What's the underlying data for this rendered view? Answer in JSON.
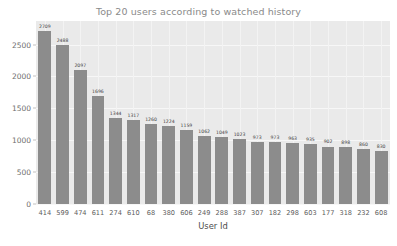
{
  "chart_data": {
    "type": "bar",
    "title": "Top 20 users according to watched history",
    "xlabel": "User Id",
    "ylabel": "",
    "categories": [
      "414",
      "599",
      "474",
      "611",
      "274",
      "610",
      "68",
      "380",
      "606",
      "249",
      "288",
      "387",
      "307",
      "182",
      "298",
      "603",
      "177",
      "318",
      "232",
      "608"
    ],
    "values": [
      2709,
      2488,
      2097,
      1696,
      1344,
      1317,
      1260,
      1224,
      1159,
      1062,
      1049,
      1023,
      973,
      973,
      963,
      935,
      902,
      898,
      860,
      830
    ],
    "value_labels": [
      "2709",
      "2488",
      "2097",
      "1696",
      "1344",
      "1317",
      "1260",
      "1224",
      "1159",
      "1062",
      "1049",
      "1023",
      "973",
      "973",
      "963",
      "935",
      "902",
      "898",
      "860",
      "830"
    ],
    "ylim": [
      0,
      2870
    ],
    "yticks": [
      0,
      500,
      1000,
      1500,
      2000,
      2500
    ],
    "ytick_labels": [
      "0",
      "500",
      "1000",
      "1500",
      "2000",
      "2500"
    ],
    "grid": true,
    "legend": null,
    "bar_color": "#8c8c8c",
    "plot_background": "#eaeaea",
    "grid_color": "#f5f5f5",
    "title_color": "#8a8a8a",
    "tick_color": "#6e6e6e"
  }
}
